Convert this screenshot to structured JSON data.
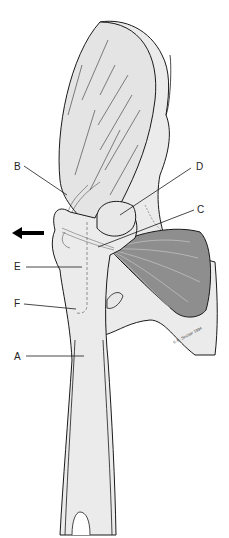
{
  "figure": {
    "type": "anatomical-illustration",
    "labels": [
      {
        "id": "A",
        "text": "A"
      },
      {
        "id": "B",
        "text": "B"
      },
      {
        "id": "C",
        "text": "C"
      },
      {
        "id": "D",
        "text": "D"
      },
      {
        "id": "E",
        "text": "E"
      },
      {
        "id": "F",
        "text": "F"
      }
    ],
    "signature": "© B. Sinclair 1994",
    "colors": {
      "bone_fill": "#ebebeb",
      "muscle_fill": "#e4e4e4",
      "dark_muscle_fill": "#8e8e8e",
      "outline": "#1a1a1a",
      "arrow": "#000000"
    }
  }
}
